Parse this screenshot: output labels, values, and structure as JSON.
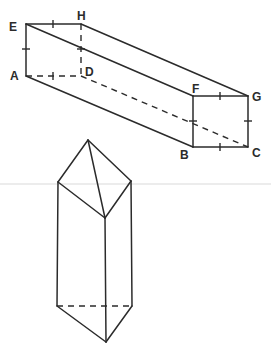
{
  "figure": {
    "cuboid": {
      "vertices": [
        {
          "name": "A",
          "label": "A",
          "x": 26,
          "y": 76
        },
        {
          "name": "B",
          "label": "B",
          "x": 193,
          "y": 147
        },
        {
          "name": "C",
          "label": "C",
          "x": 248,
          "y": 147
        },
        {
          "name": "D",
          "label": "D",
          "x": 81,
          "y": 76
        },
        {
          "name": "E",
          "label": "E",
          "x": 26,
          "y": 24
        },
        {
          "name": "F",
          "label": "F",
          "x": 193,
          "y": 96
        },
        {
          "name": "G",
          "label": "G",
          "x": 248,
          "y": 96
        },
        {
          "name": "H",
          "label": "H",
          "x": 81,
          "y": 24
        }
      ],
      "solid_edges": [
        "EH",
        "EA",
        "AB",
        "EF",
        "HG",
        "FG",
        "FB",
        "GC",
        "BC"
      ],
      "hidden_edges": [
        "AD",
        "DH",
        "DC"
      ],
      "equal_length_ticks": [
        "EH",
        "EA",
        "AD",
        "DH",
        "FG",
        "FB",
        "GC",
        "BC"
      ]
    },
    "prism": {
      "apex_top": {
        "x": 88,
        "y": 140
      },
      "top_left": {
        "x": 58,
        "y": 182
      },
      "top_right": {
        "x": 131,
        "y": 181
      },
      "top_front": {
        "x": 105,
        "y": 218
      },
      "bottom_left": {
        "x": 57,
        "y": 306
      },
      "bottom_right": {
        "x": 132,
        "y": 306
      },
      "bottom_front": {
        "x": 106,
        "y": 342
      },
      "hidden_edges": [
        "bottom_left-bottom_right"
      ]
    }
  }
}
